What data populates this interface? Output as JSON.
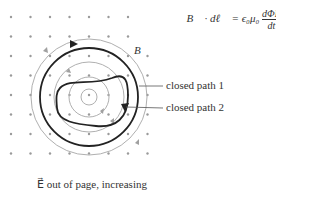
{
  "equation": {
    "lhs": "∮B⃗ · dℓ⃗",
    "equals": "=",
    "const": "ϵ₀μ₀",
    "frac_num": "dΦE",
    "frac_den": "dt"
  },
  "labels": {
    "field_B": "B",
    "path1": "closed path 1",
    "path2": "closed path 2",
    "caption": "E⃗ out of page, increasing"
  },
  "colors": {
    "dots": "#999999",
    "field_lines": "#aaaaaa",
    "paths": "#222222",
    "text": "#333333"
  }
}
